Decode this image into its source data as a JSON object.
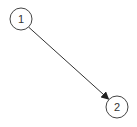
{
  "diagram": {
    "type": "directed-graph",
    "nodes": [
      {
        "id": "1",
        "label": "1",
        "cx": 21,
        "cy": 19,
        "r": 11
      },
      {
        "id": "2",
        "label": "2",
        "cx": 117,
        "cy": 107,
        "r": 11
      }
    ],
    "edges": [
      {
        "from": "1",
        "to": "2",
        "directed": true
      }
    ],
    "colors": {
      "stroke": "#333333",
      "background": "#ffffff"
    }
  }
}
